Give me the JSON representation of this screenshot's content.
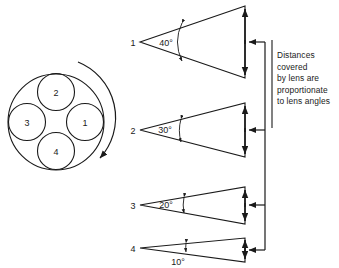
{
  "diagram": {
    "turret": {
      "name": "rotating-lens-turret",
      "lenses": [
        {
          "id": "2",
          "label": "2",
          "position": "top"
        },
        {
          "id": "3",
          "label": "3",
          "position": "left"
        },
        {
          "id": "1",
          "label": "1",
          "position": "right"
        },
        {
          "id": "4",
          "label": "4",
          "position": "bottom"
        }
      ],
      "rotation": "clockwise"
    },
    "cones": [
      {
        "id": "1",
        "label": "1",
        "angle_label": "40°",
        "angle_value": 40
      },
      {
        "id": "2",
        "label": "2",
        "angle_label": "30°",
        "angle_value": 30
      },
      {
        "id": "3",
        "label": "3",
        "angle_label": "20°",
        "angle_value": 20
      },
      {
        "id": "4",
        "label": "4",
        "angle_label": "10°",
        "angle_value": 10
      }
    ],
    "note": {
      "lines": [
        "Distances",
        "covered",
        "by lens  are",
        "proportionate",
        "to lens angles"
      ]
    },
    "colors": {
      "stroke": "#1a1a1a",
      "background": "#ffffff",
      "text": "#1a1a1a"
    }
  }
}
